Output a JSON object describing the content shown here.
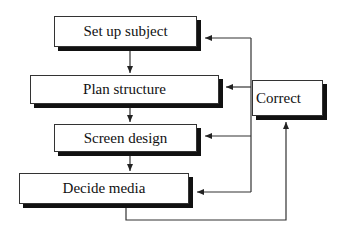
{
  "diagram": {
    "type": "flowchart",
    "steps": [
      {
        "id": "setup",
        "label": "Set up subject"
      },
      {
        "id": "plan",
        "label": "Plan structure"
      },
      {
        "id": "screen",
        "label": "Screen design"
      },
      {
        "id": "media",
        "label": "Decide media"
      }
    ],
    "feedback": {
      "id": "correct",
      "label": "Correct"
    },
    "edges": [
      {
        "from": "setup",
        "to": "plan"
      },
      {
        "from": "plan",
        "to": "screen"
      },
      {
        "from": "screen",
        "to": "media"
      },
      {
        "from": "media",
        "to": "correct"
      },
      {
        "from": "correct",
        "to": "setup"
      },
      {
        "from": "correct",
        "to": "plan"
      },
      {
        "from": "correct",
        "to": "screen"
      },
      {
        "from": "correct",
        "to": "media"
      }
    ],
    "colors": {
      "line": "#333333",
      "shadow": "#111111",
      "background": "#ffffff"
    }
  }
}
